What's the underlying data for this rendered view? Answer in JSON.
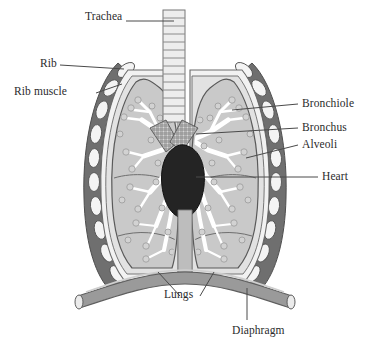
{
  "diagram": {
    "background_color": "#ffffff",
    "width": 370,
    "height": 351,
    "labels": [
      {
        "id": "trachea",
        "text": "Trachea",
        "x": 85,
        "y": 16,
        "align": "left"
      },
      {
        "id": "rib",
        "text": "Rib",
        "x": 40,
        "y": 60,
        "align": "left"
      },
      {
        "id": "rib-muscle",
        "text": "Rib muscle",
        "x": 16,
        "y": 88,
        "align": "left"
      },
      {
        "id": "bronchiole",
        "text": "Bronchiole",
        "x": 302,
        "y": 99,
        "align": "left"
      },
      {
        "id": "bronchus",
        "text": "Bronchus",
        "x": 302,
        "y": 124,
        "align": "left"
      },
      {
        "id": "alveoli",
        "text": "Alveoli",
        "x": 302,
        "y": 140,
        "align": "left"
      },
      {
        "id": "heart",
        "text": "Heart",
        "x": 322,
        "y": 172,
        "align": "left"
      },
      {
        "id": "lungs",
        "text": "Lungs",
        "x": 164,
        "y": 290,
        "align": "left"
      },
      {
        "id": "diaphragm",
        "text": "Diaphragm",
        "x": 232,
        "y": 327,
        "align": "left"
      }
    ],
    "colors": {
      "label_text": "#2b2b2b",
      "leader_line": "#4a4a4a",
      "lung_fill": "#c9c9c9",
      "lung_inner_fill": "#d4d4d4",
      "pleura_light": "#f2f2f2",
      "rib_muscle": "#6f6f6f",
      "rib_bone": "#f4f4f4",
      "heart_fill": "#242424",
      "diaphragm_fill": "#9a9a9a",
      "trachea_fill": "#ededed",
      "bronchus_hatch": "#8a8a8a",
      "outline": "#5a5a5a",
      "airway_white": "#ffffff"
    }
  }
}
